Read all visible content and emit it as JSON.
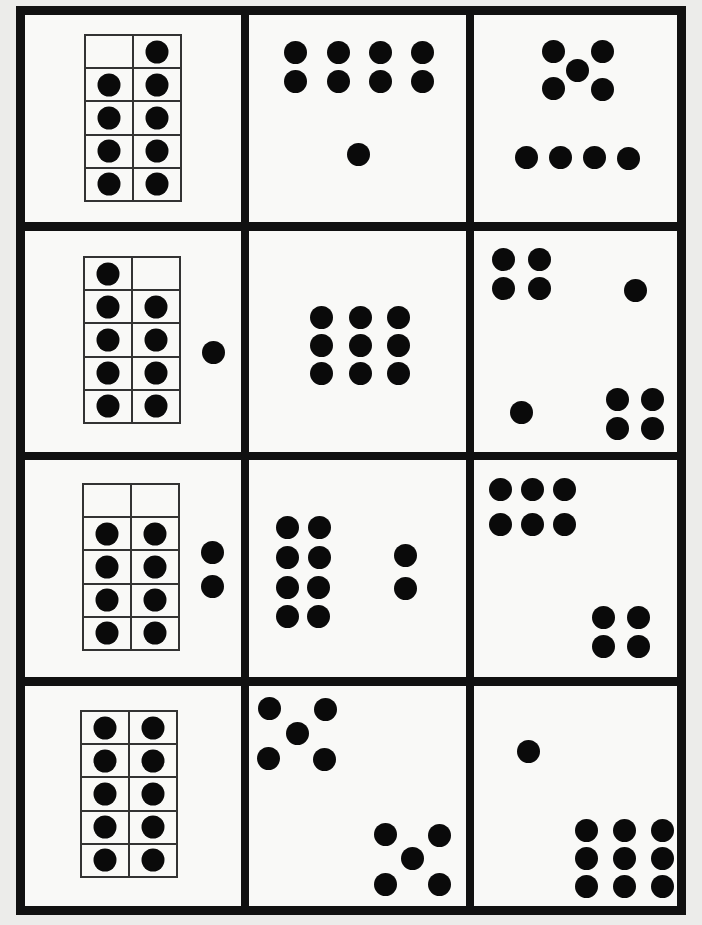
{
  "sheet": {
    "title": "Ten-frame and dot pattern cards",
    "border_color": "#111111",
    "dot_color": "#0a0a0a",
    "rows": 4,
    "cols": 3
  },
  "cards": [
    {
      "id": "r1c1",
      "label": "9",
      "type": "ten-frame",
      "frame_filled": [
        0,
        1,
        1,
        1,
        1,
        1,
        1,
        1,
        1,
        1
      ],
      "extra_dots": 0,
      "total": 9
    },
    {
      "id": "r1c2",
      "label": "9",
      "type": "dot-pattern",
      "groups": [
        "8 in 2x4 array",
        "1 single"
      ],
      "total": 9
    },
    {
      "id": "r1c3",
      "label": "9",
      "type": "dot-pattern",
      "groups": [
        "5 dice pattern",
        "4 in a row"
      ],
      "total": 9
    },
    {
      "id": "r2c1",
      "label": "10",
      "type": "ten-frame",
      "frame_filled": [
        1,
        0,
        1,
        1,
        1,
        1,
        1,
        1,
        1,
        1
      ],
      "extra_dots": 1,
      "total": 10
    },
    {
      "id": "r2c2",
      "label": "9",
      "type": "dot-pattern",
      "groups": [
        "9 in 3x3 array"
      ],
      "total": 9
    },
    {
      "id": "r2c3",
      "label": "10",
      "type": "dot-pattern",
      "groups": [
        "4 in 2x2",
        "1 single",
        "1 single",
        "4 in 2x2"
      ],
      "total": 10
    },
    {
      "id": "r3c1",
      "label": "10",
      "type": "ten-frame",
      "frame_filled": [
        0,
        0,
        1,
        1,
        1,
        1,
        1,
        1,
        1,
        1
      ],
      "extra_dots": 2,
      "total": 10
    },
    {
      "id": "r3c2",
      "label": "10",
      "type": "dot-pattern",
      "groups": [
        "8 in 4x2 array",
        "2 vertical"
      ],
      "total": 10
    },
    {
      "id": "r3c3",
      "label": "10",
      "type": "dot-pattern",
      "groups": [
        "6 in 2x3 array",
        "4 in 2x2"
      ],
      "total": 10
    },
    {
      "id": "r4c1",
      "label": "10",
      "type": "ten-frame",
      "frame_filled": [
        1,
        1,
        1,
        1,
        1,
        1,
        1,
        1,
        1,
        1
      ],
      "extra_dots": 0,
      "total": 10
    },
    {
      "id": "r4c2",
      "label": "10",
      "type": "dot-pattern",
      "groups": [
        "5 dice pattern",
        "5 dice pattern"
      ],
      "total": 10
    },
    {
      "id": "r4c3",
      "label": "10",
      "type": "dot-pattern",
      "groups": [
        "1 single",
        "9 in 3x3 array"
      ],
      "total": 10
    }
  ]
}
